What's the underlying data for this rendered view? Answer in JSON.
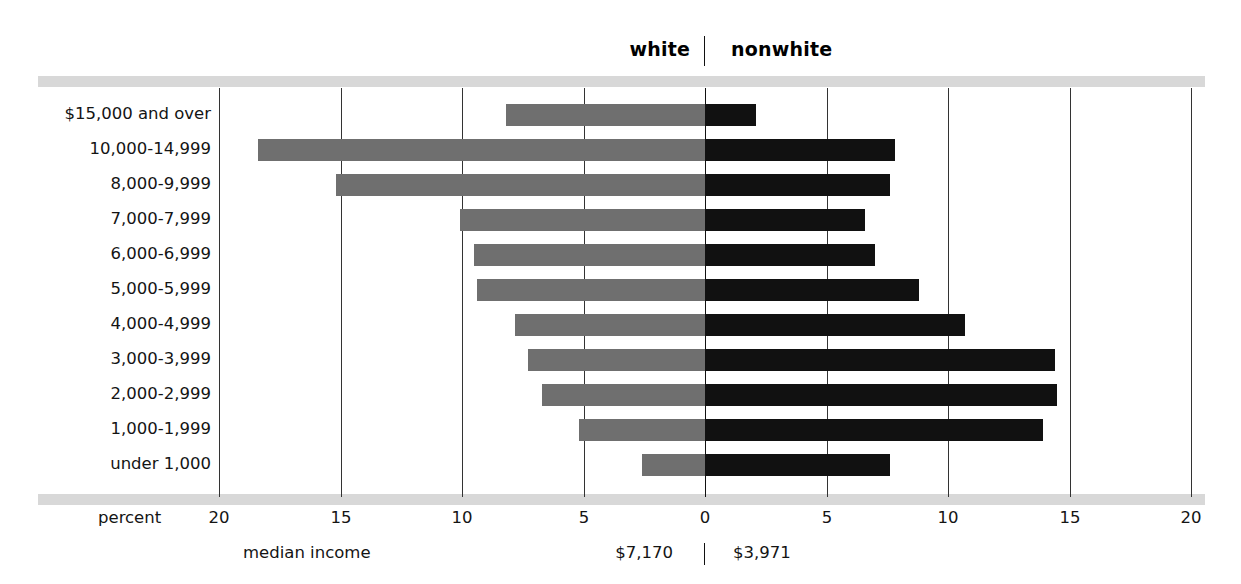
{
  "legend": {
    "left_label": "white",
    "right_label": "nonwhite"
  },
  "axis": {
    "name": "percent",
    "left_ticks": [
      "20",
      "15",
      "10",
      "5"
    ],
    "right_ticks": [
      "0",
      "5",
      "10",
      "15",
      "20"
    ]
  },
  "median": {
    "name": "median income",
    "white": "$7,170",
    "nonwhite": "$3,971"
  },
  "colors": {
    "white_bar": "#6f6f6f",
    "nonwhite_bar": "#111111",
    "rail": "#d8d8d8",
    "gridline": "#333333"
  },
  "chart_data": {
    "type": "bar",
    "subtype": "diverging-population-pyramid",
    "title": "",
    "xlabel": "percent",
    "ylabel": "",
    "xlim": [
      -20,
      20
    ],
    "grid": true,
    "grid_ticks": [
      -20,
      -15,
      -10,
      -5,
      0,
      5,
      10,
      15,
      20
    ],
    "legend_position": "top-center",
    "categories": [
      "$15,000 and over",
      "10,000-14,999",
      "8,000-9,999",
      "7,000-7,999",
      "6,000-6,999",
      "5,000-5,999",
      "4,000-4,999",
      "3,000-3,999",
      "2,000-2,999",
      "1,000-1,999",
      "under 1,000"
    ],
    "series": [
      {
        "name": "white",
        "direction": "left",
        "color": "#6f6f6f",
        "values": [
          8.2,
          18.4,
          15.2,
          10.1,
          9.5,
          9.4,
          7.8,
          7.3,
          6.7,
          5.2,
          2.6
        ]
      },
      {
        "name": "nonwhite",
        "direction": "right",
        "color": "#111111",
        "values": [
          2.1,
          7.8,
          7.6,
          6.6,
          7.0,
          8.8,
          10.7,
          14.4,
          14.5,
          13.9,
          7.6
        ]
      }
    ],
    "annotations": [
      {
        "label": "median income (white)",
        "value": "$7,170"
      },
      {
        "label": "median income (nonwhite)",
        "value": "$3,971"
      }
    ]
  }
}
